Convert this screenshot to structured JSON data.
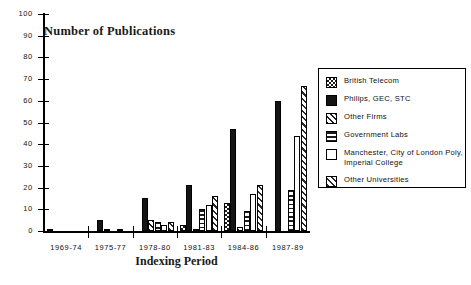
{
  "chart_data": {
    "type": "bar",
    "title": "Number of Publications",
    "xlabel": "Indexing Period",
    "ylabel": "",
    "ylim": [
      0,
      100
    ],
    "ytick_step": 10,
    "yticks": [
      "0",
      "10",
      "20",
      "30",
      "40",
      "50",
      "60",
      "70",
      "80",
      "90",
      "100"
    ],
    "grid": false,
    "legend_position": "right",
    "categories": [
      "1969-74",
      "1975-77",
      "1978-80",
      "1981-83",
      "1984-86",
      "1987-89"
    ],
    "series": [
      {
        "name": "British Telecom",
        "pattern": "checker",
        "values": [
          1,
          0,
          0,
          3,
          13,
          0
        ]
      },
      {
        "name": "Philips, GEC, STC",
        "pattern": "solid",
        "values": [
          0,
          5,
          15,
          21,
          47,
          60
        ]
      },
      {
        "name": "Other Firms",
        "pattern": "diagonal",
        "values": [
          0,
          1,
          5,
          1,
          2,
          0
        ]
      },
      {
        "name": "Government Labs",
        "pattern": "horizontal",
        "values": [
          0,
          0,
          4,
          10,
          9,
          19
        ]
      },
      {
        "name": "Manchester, City of London Poly, Imperial College",
        "pattern": "open",
        "values": [
          0,
          1,
          3,
          12,
          17,
          44
        ]
      },
      {
        "name": "Other Universities",
        "pattern": "diagonal2",
        "values": [
          0,
          0,
          4,
          16,
          21,
          67
        ]
      }
    ]
  },
  "legend": {
    "items": [
      {
        "label": "British Telecom",
        "pattern": "checker"
      },
      {
        "label": "Philips, GEC, STC",
        "pattern": "solid"
      },
      {
        "label": "Other Firms",
        "pattern": "diagonal"
      },
      {
        "label": "Government Labs",
        "pattern": "horizontal"
      },
      {
        "label": "Manchester, City of London Poly,\nImperial College",
        "pattern": "open"
      },
      {
        "label": "Other Universities",
        "pattern": "diagonal2"
      }
    ]
  },
  "colors": {
    "axis": "#000000",
    "ink": "#1c1c1c",
    "background": "#ffffff"
  }
}
